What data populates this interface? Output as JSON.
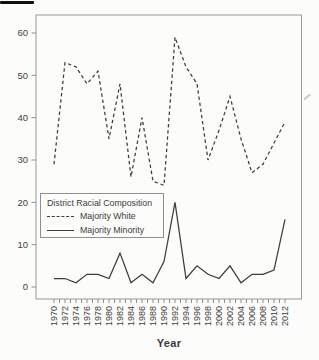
{
  "figure": {
    "xlabel": "Year",
    "background": "#fcfcfa"
  },
  "chart_data": {
    "type": "line",
    "title": "",
    "xlabel": "Year",
    "ylabel": "",
    "x": [
      1970,
      1972,
      1974,
      1976,
      1978,
      1980,
      1982,
      1984,
      1986,
      1988,
      1990,
      1992,
      1994,
      1996,
      1998,
      2000,
      2002,
      2004,
      2006,
      2008,
      2010,
      2012
    ],
    "series": [
      {
        "name": "Majority White",
        "style": "dashed",
        "values": [
          29,
          53,
          52,
          48,
          51,
          35,
          48,
          26,
          40,
          25,
          24,
          59,
          52,
          48,
          30,
          37,
          45,
          35,
          27,
          29,
          34,
          39
        ]
      },
      {
        "name": "Majority Minority",
        "style": "solid",
        "values": [
          2,
          2,
          1,
          3,
          3,
          2,
          8,
          1,
          3,
          1,
          6,
          20,
          2,
          5,
          3,
          2,
          5,
          1,
          3,
          3,
          4,
          16
        ]
      }
    ],
    "ylim": [
      0,
      60
    ],
    "yticks": [
      0,
      10,
      20,
      30,
      40,
      50,
      60
    ],
    "x_minor_tick_every_year": true,
    "x_label_every_n_years": 2,
    "x_labels_rotated_degrees": 90,
    "grid": false,
    "legend": {
      "title": "District Racial Composition",
      "position": "middle-left"
    },
    "colors": {
      "line": "#3c3c3c",
      "axis": "#8f8f8f",
      "text": "#3f3f3f"
    }
  }
}
